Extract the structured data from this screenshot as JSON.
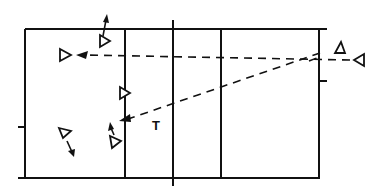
{
  "diagram": {
    "type": "volleyball-court-play-diagram",
    "colors": {
      "line": "#111111",
      "background": "#ffffff"
    },
    "court": {
      "left": 25,
      "top": 29,
      "right": 319,
      "bottom": 178,
      "lines_x": [
        125,
        173,
        221
      ],
      "net_x": 173,
      "ticks": [
        {
          "side": "left",
          "y": 128
        },
        {
          "side": "right",
          "y": 81
        }
      ]
    },
    "labels": [
      {
        "id": "t-label",
        "text": "T",
        "x": 157,
        "y": 127
      }
    ],
    "players": [
      {
        "id": "player-top-left-arrow-up",
        "x": 104,
        "y": 41,
        "dir": "right"
      },
      {
        "id": "player-left-receiver",
        "x": 65,
        "y": 55,
        "dir": "right"
      },
      {
        "id": "player-at-line",
        "x": 123,
        "y": 93,
        "dir": "right"
      },
      {
        "id": "player-lower-left",
        "x": 64,
        "y": 133,
        "dir": "down-right"
      },
      {
        "id": "player-lower-mid",
        "x": 115,
        "y": 142,
        "dir": "right"
      },
      {
        "id": "server-upper-right",
        "x": 340,
        "y": 49,
        "dir": "up"
      },
      {
        "id": "server-right",
        "x": 359,
        "y": 60,
        "dir": "left"
      }
    ]
  }
}
